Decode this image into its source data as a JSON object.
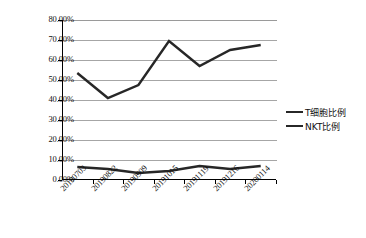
{
  "chart_data": {
    "type": "line",
    "title": "",
    "xlabel": "",
    "ylabel": "",
    "categories": [
      "20190703",
      "20190822",
      "20190909",
      "20191015",
      "20191119",
      "20191216",
      "20200114"
    ],
    "series": [
      {
        "name": "T细胞比例",
        "values": [
          53.5,
          41.0,
          47.5,
          69.5,
          57.0,
          65.0,
          67.5
        ],
        "color": "#272727"
      },
      {
        "name": "NKT比例",
        "values": [
          6.5,
          5.5,
          3.5,
          4.5,
          7.0,
          5.5,
          7.0
        ],
        "color": "#272727"
      }
    ],
    "ylim": [
      0,
      80
    ],
    "ytick_values": [
      0,
      10,
      20,
      30,
      40,
      50,
      60,
      70,
      80
    ],
    "ytick_labels": [
      "0.00%",
      "10.00%",
      "20.00%",
      "30.00%",
      "40.00%",
      "50.00%",
      "60.00%",
      "70.00%",
      "80.00%"
    ],
    "grid": true,
    "grid_axis": "y",
    "legend_position": "right",
    "value_suffix": "%"
  },
  "legend": {
    "items": [
      {
        "label": "T细胞比例"
      },
      {
        "label": "NKT比例"
      }
    ]
  }
}
